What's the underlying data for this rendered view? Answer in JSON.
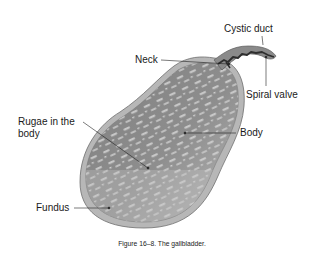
{
  "figure": {
    "caption": "Figure 16–8.  The gallbladder.",
    "subject": "gallbladder"
  },
  "labels": {
    "cystic_duct": "Cystic duct",
    "neck": "Neck",
    "spiral_valve": "Spiral valve",
    "rugae_line1": "Rugae in the",
    "rugae_line2": "body",
    "body": "Body",
    "fundus": "Fundus"
  },
  "colors": {
    "organ_fill": "#8c8c8c",
    "organ_outer": "#b5b5b5",
    "organ_outline": "#6e6e6e",
    "rugae": "#cfcfcf",
    "duct_dark": "#2e2e2e",
    "text": "#1a1a1a"
  }
}
